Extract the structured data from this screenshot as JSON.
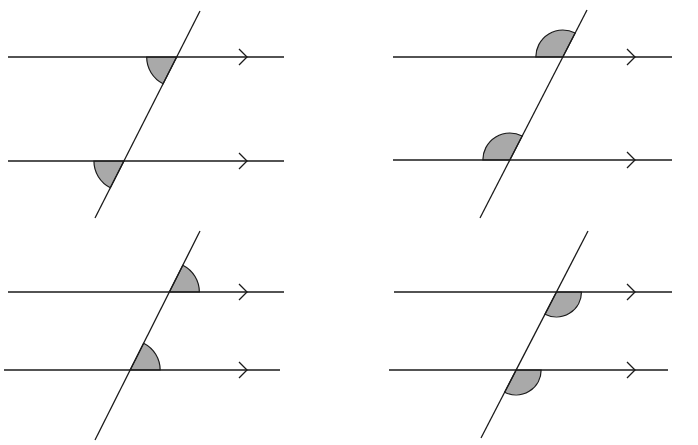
{
  "diagram": {
    "colors": {
      "line": "#1a1a1a",
      "angle_fill": "#a9a9a9",
      "background": "#ffffff"
    },
    "panels": [
      {
        "name": "top-left",
        "angle_pair": "corresponding",
        "angle_position": "below-left",
        "angle_kind": "acute"
      },
      {
        "name": "top-right",
        "angle_pair": "corresponding",
        "angle_position": "above-left",
        "angle_kind": "obtuse"
      },
      {
        "name": "bottom-left",
        "angle_pair": "corresponding",
        "angle_position": "above-right",
        "angle_kind": "acute"
      },
      {
        "name": "bottom-right",
        "angle_pair": "corresponding",
        "angle_position": "below-right",
        "angle_kind": "obtuse"
      }
    ]
  }
}
